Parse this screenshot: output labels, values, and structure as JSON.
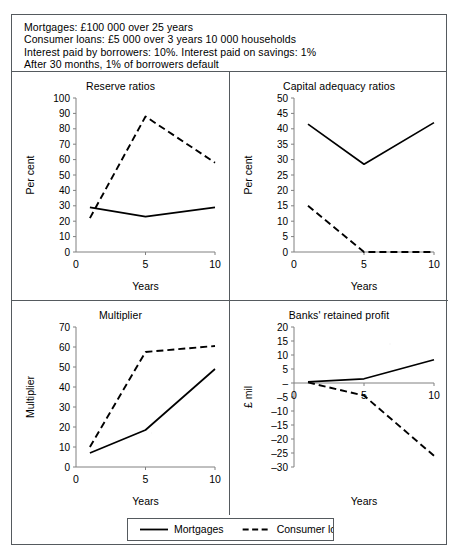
{
  "figure": {
    "assumptions": [
      "Mortgages: £100 000 over 25 years",
      "Consumer loans: £5 000 over 3 years 10 000 households",
      "Interest paid by borrowers: 10%. Interest paid on savings: 1%",
      "After 30 months, 1% of borrowers default"
    ],
    "legend": {
      "items": [
        {
          "label": "Mortgages",
          "style": "solid"
        },
        {
          "label": "Consumer loans",
          "style": "dashed"
        }
      ]
    },
    "series_colors": {
      "line": "#000000",
      "axis": "#808080",
      "border": "#555a5e"
    }
  },
  "chart_data": [
    {
      "type": "line",
      "title": "Reserve ratios",
      "xlabel": "Years",
      "ylabel": "Per cent",
      "x": [
        1,
        5,
        10
      ],
      "xticks": [
        0,
        5,
        10
      ],
      "xlim": [
        0,
        10
      ],
      "yticks": [
        0,
        10,
        20,
        30,
        40,
        50,
        60,
        70,
        80,
        90,
        100
      ],
      "ylim": [
        0,
        100
      ],
      "grid": false,
      "legend_position": "below-figure",
      "series": [
        {
          "name": "Mortgages",
          "style": "solid",
          "values": [
            29,
            23,
            29
          ]
        },
        {
          "name": "Consumer loans",
          "style": "dashed",
          "values": [
            22,
            88,
            58
          ]
        }
      ]
    },
    {
      "type": "line",
      "title": "Capital adequacy ratios",
      "xlabel": "Years",
      "ylabel": "Per cent",
      "x": [
        1,
        5,
        10
      ],
      "xticks": [
        0,
        5,
        10
      ],
      "xlim": [
        0,
        10
      ],
      "yticks": [
        0,
        5,
        10,
        15,
        20,
        25,
        30,
        35,
        40,
        45,
        50
      ],
      "ylim": [
        0,
        50
      ],
      "grid": false,
      "legend_position": "below-figure",
      "series": [
        {
          "name": "Mortgages",
          "style": "solid",
          "values": [
            41.5,
            28.5,
            42
          ]
        },
        {
          "name": "Consumer loans",
          "style": "dashed",
          "values": [
            15,
            0,
            0
          ]
        }
      ]
    },
    {
      "type": "line",
      "title": "Multiplier",
      "xlabel": "Years",
      "ylabel": "Multiplier",
      "x": [
        1,
        5,
        10
      ],
      "xticks": [
        0,
        5,
        10
      ],
      "xlim": [
        0,
        10
      ],
      "yticks": [
        0,
        10,
        20,
        30,
        40,
        50,
        60,
        70
      ],
      "ylim": [
        0,
        70
      ],
      "grid": false,
      "legend_position": "below-figure",
      "series": [
        {
          "name": "Mortgages",
          "style": "solid",
          "values": [
            7,
            18.5,
            49
          ]
        },
        {
          "name": "Consumer loans",
          "style": "dashed",
          "values": [
            10,
            57.5,
            60.5
          ]
        }
      ]
    },
    {
      "type": "line",
      "title": "Banks' retained profit",
      "xlabel": "Years",
      "ylabel": "£ mil",
      "x": [
        1,
        5,
        10
      ],
      "xticks": [
        0,
        5,
        10
      ],
      "xlim": [
        0,
        10
      ],
      "yticks": [
        -30,
        -25,
        -20,
        -15,
        -10,
        -5,
        0,
        5,
        10,
        15,
        20
      ],
      "yticklabels": [
        "–30",
        "–25",
        "–20",
        "–15",
        "–10",
        "–5",
        "–",
        "5",
        "10",
        "15",
        "20"
      ],
      "ylim": [
        -30,
        20
      ],
      "grid": false,
      "legend_position": "below-figure",
      "series": [
        {
          "name": "Mortgages",
          "style": "solid",
          "values": [
            0.4,
            1.5,
            8.3
          ]
        },
        {
          "name": "Consumer loans",
          "style": "dashed",
          "values": [
            0.2,
            -4.5,
            -26
          ]
        }
      ]
    }
  ]
}
